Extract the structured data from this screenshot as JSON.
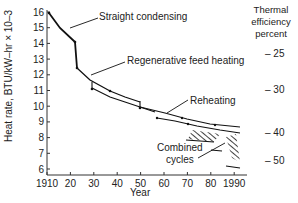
{
  "chart_data": {
    "type": "line",
    "title": "",
    "xlabel": "Year",
    "ylabel": "Heat rate, BTU/kW–hr × 10–3",
    "y2label": [
      "Thermal",
      "efficiency",
      "percent"
    ],
    "xlim": [
      1910,
      1995
    ],
    "ylim": [
      6,
      16
    ],
    "x_ticks": [
      "1910",
      "20",
      "30",
      "40",
      "50",
      "60",
      "70",
      "80",
      "1990"
    ],
    "x_tick_values": [
      1910,
      1920,
      1930,
      1940,
      1950,
      1960,
      1970,
      1980,
      1990
    ],
    "y_ticks": [
      "6",
      "7",
      "8",
      "9",
      "10",
      "11",
      "12",
      "13",
      "14",
      "15",
      "16"
    ],
    "y2_ticks": [
      {
        "label": "– 25",
        "heat_rate": 13.6
      },
      {
        "label": "– 30",
        "heat_rate": 11.4
      },
      {
        "label": "– 40",
        "heat_rate": 8.5
      },
      {
        "label": "– 50",
        "heat_rate": 6.8
      }
    ],
    "grid": false,
    "series": [
      {
        "name": "Straight condensing",
        "points": [
          [
            1911,
            16.0
          ],
          [
            1916,
            15.0
          ],
          [
            1922,
            14.1
          ],
          [
            1922,
            12.5
          ]
        ]
      },
      {
        "name": "Regenerative feed heating",
        "points": [
          [
            1922,
            12.5
          ],
          [
            1927,
            11.8
          ],
          [
            1935,
            11.0
          ],
          [
            1942,
            10.6
          ],
          [
            1949,
            10.3
          ]
        ]
      },
      {
        "name": "Regenerative feed heating (lower bound)",
        "points": [
          [
            1927,
            11.1
          ],
          [
            1935,
            10.6
          ],
          [
            1942,
            10.2
          ],
          [
            1949,
            9.9
          ],
          [
            1955,
            9.6
          ]
        ]
      },
      {
        "name": "Reheating",
        "points": [
          [
            1949,
            9.9
          ],
          [
            1960,
            9.5
          ],
          [
            1970,
            9.1
          ],
          [
            1980,
            8.8
          ],
          [
            1994,
            8.6
          ]
        ]
      },
      {
        "name": "Reheating (lower bound)",
        "points": [
          [
            1957,
            9.3
          ],
          [
            1965,
            9.0
          ],
          [
            1975,
            8.7
          ],
          [
            1985,
            8.5
          ],
          [
            1994,
            8.3
          ]
        ]
      }
    ],
    "hatched_regions": [
      {
        "name": "Combined cycles (1970s)",
        "x": [
          1970,
          1984
        ],
        "y": [
          7.8,
          8.4
        ]
      },
      {
        "name": "Combined cycles (1990s)",
        "x": [
          1985,
          1994
        ],
        "y": [
          6.1,
          8.2
        ]
      }
    ],
    "annotations": [
      "Straight condensing",
      "Regenerative feed heating",
      "Reheating",
      "Combined cycles"
    ]
  },
  "labels": {
    "straight": "Straight condensing",
    "regen": "Regenerative feed heating",
    "reheat": "Reheating",
    "combined1": "Combined",
    "combined2": "cycles",
    "xlabel": "Year",
    "ylabel": "Heat rate, BTU/kW–hr × 10–3",
    "right1": "Thermal",
    "right2": "efficiency",
    "right3": "percent"
  }
}
